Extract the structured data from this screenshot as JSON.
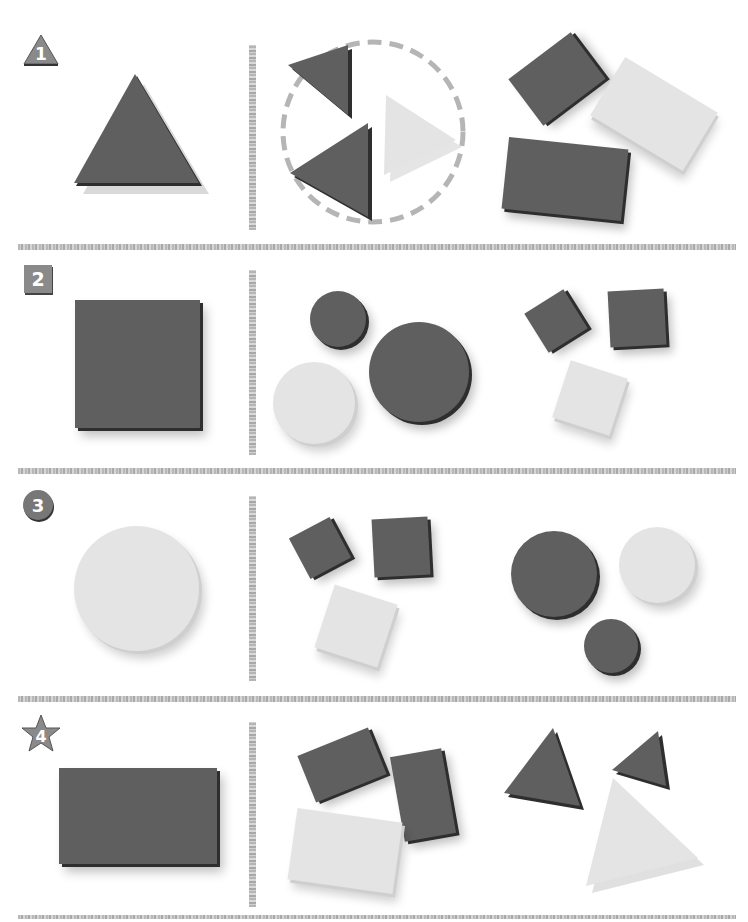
{
  "page": {
    "type": "shape matching worksheet",
    "colors": {
      "dark_shape": "#5f5f5f",
      "light_shape": "#e4e4e4",
      "badge": "#8a8a8a",
      "separator": "#bdbdbd",
      "dashed_circle": "#b5b5b5"
    }
  },
  "problems": [
    {
      "number": "1",
      "badge_shape": "triangle",
      "target_shape": "dark triangle",
      "option_a": {
        "label": "triangles",
        "items": [
          "dark triangle small",
          "light triangle",
          "dark triangle large"
        ],
        "circled": true
      },
      "option_b": {
        "label": "rectangles",
        "items": [
          "dark rectangle small",
          "light rectangle",
          "dark rectangle large"
        ],
        "circled": false
      }
    },
    {
      "number": "2",
      "badge_shape": "square",
      "target_shape": "dark square",
      "option_a": {
        "label": "circles",
        "items": [
          "dark circle small",
          "dark circle large",
          "light circle"
        ],
        "circled": false
      },
      "option_b": {
        "label": "squares",
        "items": [
          "dark square small",
          "dark square",
          "light square"
        ],
        "circled": false
      }
    },
    {
      "number": "3",
      "badge_shape": "circle",
      "target_shape": "light circle",
      "option_a": {
        "label": "squares",
        "items": [
          "dark square small",
          "dark square",
          "light square"
        ],
        "circled": false
      },
      "option_b": {
        "label": "circles",
        "items": [
          "dark circle large",
          "light circle",
          "dark circle small"
        ],
        "circled": false
      }
    },
    {
      "number": "4",
      "badge_shape": "star",
      "target_shape": "dark rectangle",
      "option_a": {
        "label": "rectangles",
        "items": [
          "dark rectangle",
          "dark rectangle vertical",
          "light rectangle"
        ],
        "circled": false
      },
      "option_b": {
        "label": "triangles",
        "items": [
          "dark triangle large",
          "dark triangle small",
          "light triangle"
        ],
        "circled": false
      }
    }
  ]
}
